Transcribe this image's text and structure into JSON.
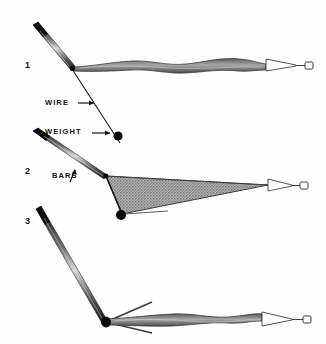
{
  "figure": {
    "kind": "scientific-line-illustration",
    "background_color": "#fefefe",
    "ink_color": "#111111",
    "shade_color": "#9a9a9a",
    "panels": [
      {
        "number": "1",
        "state": "closed",
        "description": "net collapsed alongside single bar, towing wire angled up-left"
      },
      {
        "number": "2",
        "state": "open",
        "description": "bars spread apart, net billowed into shaded triangle"
      },
      {
        "number": "3",
        "state": "opening",
        "description": "bars partly splayed, net trailing behind"
      }
    ],
    "callouts": [
      {
        "id": "wire",
        "text": "WIRE",
        "arrow": "right"
      },
      {
        "id": "weight",
        "text": "WEIGHT",
        "arrow": "right"
      },
      {
        "id": "bars",
        "text": "BARS",
        "arrow": "up"
      }
    ]
  }
}
